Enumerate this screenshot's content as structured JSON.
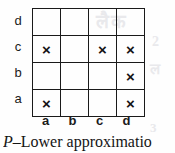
{
  "figure": {
    "type": "decision-matrix-grid",
    "caption_symbol": "P",
    "caption_separator": "–",
    "caption_text": "Lower approximatio",
    "row_labels": [
      "d",
      "c",
      "b",
      "a"
    ],
    "column_labels": [
      "a",
      "b",
      "c",
      "d"
    ],
    "cell_mark": "×",
    "empty_mark": "",
    "colors": {
      "ink": "#141414",
      "grid_line": "#1a1a1a",
      "paper": "#fefefe",
      "bleed_through": "#e9e9ec"
    },
    "rows": [
      {
        "label": "d",
        "cells": [
          "",
          "",
          "",
          ""
        ]
      },
      {
        "label": "c",
        "cells": [
          "×",
          "",
          "×",
          "×"
        ]
      },
      {
        "label": "b",
        "cells": [
          "",
          "",
          "",
          "×"
        ]
      },
      {
        "label": "a",
        "cells": [
          "×",
          "",
          "",
          "×"
        ]
      }
    ],
    "bleed_artifacts": [
      "लैक",
      "2",
      "ल",
      "3"
    ]
  }
}
